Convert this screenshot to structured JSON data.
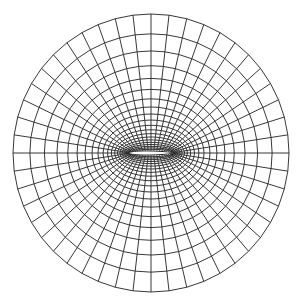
{
  "diagram": {
    "type": "o-grid-mesh-around-airfoil",
    "background": "#ffffff",
    "line_color": "#222222",
    "airfoil_fill": "#ffffff",
    "center": [
      151,
      153
    ],
    "outer_radius_x": 138,
    "outer_radius_y": 139,
    "airfoil_half_chord": 22,
    "airfoil_half_thickness": 2.5,
    "radial_line_count": 48,
    "ring_count": 20,
    "ring_growth": 1.16
  }
}
